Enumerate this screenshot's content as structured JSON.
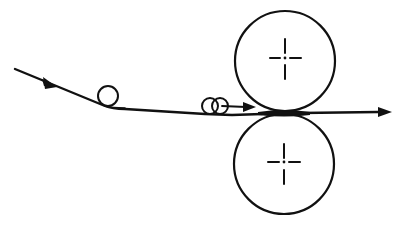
{
  "diagram": {
    "type": "roller-nip-feed-schematic",
    "colors": {
      "line": "#111111",
      "background": "#ffffff"
    },
    "elements": {
      "web_path": {
        "direction": "left-to-right",
        "arrows": 3
      },
      "guide_roller": {
        "count": 1
      },
      "pinch_rollers": {
        "count": 2
      },
      "main_rollers": {
        "count": 2,
        "center_mark": "crosshair"
      }
    }
  }
}
